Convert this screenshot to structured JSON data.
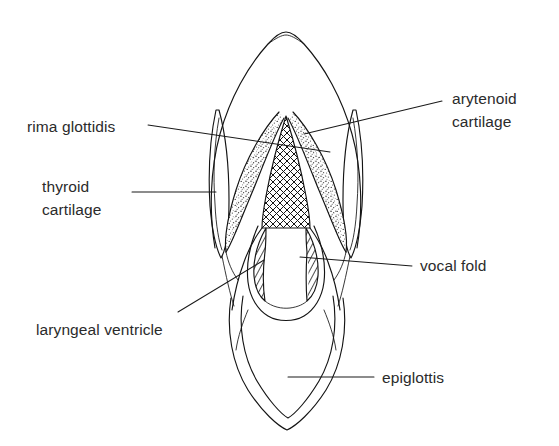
{
  "figure": {
    "background_color": "#ffffff",
    "ink_color": "#141414",
    "text_color": "#2b2b2b"
  },
  "labels": [
    {
      "id": "rima-glottidis",
      "text": "rima glottidis",
      "side": "left",
      "text_x": 27,
      "text_y": 132,
      "anchor": "start",
      "leader": {
        "x1": 148,
        "y1": 125,
        "x2": 330,
        "y2": 152
      }
    },
    {
      "id": "thyroid-cartilage",
      "text_line1": "thyroid",
      "text_line2": "cartilage",
      "side": "left",
      "text_x": 42,
      "text_y": 192,
      "anchor": "start",
      "leader": {
        "x1": 132,
        "y1": 192,
        "x2": 216,
        "y2": 192
      }
    },
    {
      "id": "laryngeal-ventricle",
      "text": "laryngeal ventricle",
      "side": "left",
      "text_x": 36,
      "text_y": 335,
      "anchor": "start",
      "leader": {
        "x1": 178,
        "y1": 312,
        "x2": 264,
        "y2": 260
      }
    },
    {
      "id": "arytenoid-cartilage",
      "text_line1": "arytenoid",
      "text_line2": "cartilage",
      "side": "right",
      "text_x": 452,
      "text_y": 104,
      "anchor": "start",
      "leader": {
        "x1": 442,
        "y1": 101,
        "x2": 304,
        "y2": 134
      }
    },
    {
      "id": "vocal-fold",
      "text": "vocal fold",
      "side": "right",
      "text_x": 420,
      "text_y": 271,
      "anchor": "start",
      "leader": {
        "x1": 412,
        "y1": 266,
        "x2": 300,
        "y2": 257
      }
    },
    {
      "id": "epiglottis",
      "text": "epiglottis",
      "side": "right",
      "text_x": 382,
      "text_y": 383,
      "anchor": "start",
      "leader": {
        "x1": 374,
        "y1": 377,
        "x2": 288,
        "y2": 377
      }
    }
  ],
  "structures": {
    "outer_cartilage": "dome-shaped outer laryngeal outline",
    "arytenoid_left": "stippled curved sliver, left of midline",
    "arytenoid_right": "stippled curved sliver, right of midline",
    "rima_glottidis": "cross-hatched central airway opening",
    "vocal_fold_left": "diagonally hatched crescent, left",
    "vocal_fold_right": "diagonally hatched crescent, right",
    "thyroid_cartilage_left": "narrow elongated outline, far left",
    "thyroid_cartilage_right": "narrow elongated outline, far right",
    "epiglottis": "double-outlined leaf shape at base"
  }
}
